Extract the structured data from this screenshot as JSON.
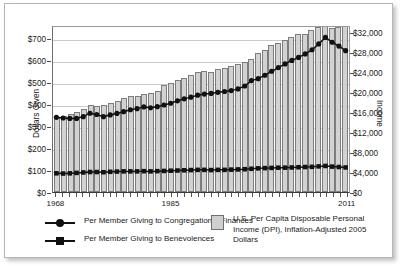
{
  "chart_data": {
    "type": "bar",
    "title": "",
    "xlabel": "",
    "ylabel": "Dollars Given",
    "y2label": "Income",
    "grid": true,
    "legend_position": "bottom",
    "x": [
      1968,
      1969,
      1970,
      1971,
      1972,
      1973,
      1974,
      1975,
      1976,
      1977,
      1978,
      1979,
      1980,
      1981,
      1982,
      1983,
      1984,
      1985,
      1986,
      1987,
      1988,
      1989,
      1990,
      1991,
      1992,
      1993,
      1994,
      1995,
      1996,
      1997,
      1998,
      1999,
      2000,
      2001,
      2002,
      2003,
      2004,
      2005,
      2006,
      2007,
      2008,
      2009,
      2010,
      2011
    ],
    "xtick_labels": [
      "1968",
      "1985",
      "2011"
    ],
    "xtick_values": [
      1968,
      1985,
      2011
    ],
    "ylim": [
      0,
      760
    ],
    "ytick_labels": [
      "$0",
      "$100",
      "$200",
      "$300",
      "$400",
      "$500",
      "$600",
      "$700"
    ],
    "ytick_values": [
      0,
      100,
      200,
      300,
      400,
      500,
      600,
      700
    ],
    "y2lim": [
      0,
      33500
    ],
    "y2tick_labels": [
      "$0",
      "$4,000",
      "$8,000",
      "$12,000",
      "$16,000",
      "$20,000",
      "$24,000",
      "$28,000",
      "$32,000"
    ],
    "y2tick_values": [
      0,
      4000,
      8000,
      12000,
      16000,
      20000,
      24000,
      28000,
      32000
    ],
    "series": [
      {
        "name": "U.S. Per Capita Disposable Personal Income (DPI), Inflation-Adjusted 2005 Dollars",
        "type": "bar",
        "axis": "right",
        "color": "#d2d2d2",
        "edge_color": "#7d7d7d",
        "values": [
          14900,
          15300,
          15700,
          16000,
          16600,
          17500,
          17300,
          17500,
          17900,
          18200,
          18900,
          19200,
          19200,
          19600,
          19800,
          20300,
          21500,
          21900,
          22500,
          22800,
          23500,
          24000,
          24200,
          24100,
          24700,
          24800,
          25200,
          25700,
          26100,
          26700,
          27900,
          28500,
          29500,
          29800,
          30400,
          31000,
          31700,
          31600,
          32500,
          33200,
          33600,
          33000,
          33200,
          33600
        ],
        "marker": "bar"
      },
      {
        "name": "Per Member Giving to Congregational Finances",
        "type": "line",
        "axis": "left",
        "color": "#111111",
        "marker": "circle",
        "values": [
          344,
          341,
          339,
          339,
          347,
          363,
          357,
          347,
          355,
          362,
          370,
          379,
          384,
          392,
          388,
          393,
          401,
          409,
          420,
          429,
          437,
          446,
          451,
          454,
          459,
          463,
          467,
          475,
          488,
          513,
          522,
          538,
          556,
          573,
          590,
          606,
          620,
          636,
          655,
          682,
          712,
          690,
          672,
          651
        ]
      },
      {
        "name": "Per Member Giving to Benevolences",
        "type": "line",
        "axis": "left",
        "color": "#111111",
        "marker": "square",
        "values": [
          86,
          85,
          86,
          88,
          90,
          92,
          92,
          91,
          93,
          94,
          95,
          95,
          95,
          96,
          95,
          96,
          97,
          98,
          99,
          100,
          101,
          102,
          102,
          101,
          102,
          102,
          103,
          104,
          105,
          107,
          109,
          110,
          111,
          112,
          112,
          113,
          114,
          115,
          116,
          118,
          120,
          117,
          115,
          113
        ]
      }
    ],
    "annotations": []
  },
  "axes": {
    "left_title": "Dollars Given",
    "right_title": "Income"
  },
  "legend": {
    "items": [
      {
        "label": "Per Member Giving to Congregational Finances",
        "marker": "circle-line-marker"
      },
      {
        "label": "Per Member Giving to Benevolences",
        "marker": "square-line-marker"
      },
      {
        "label": "U.S. Per Capita Disposable Personal Income (DPI), Inflation-Adjusted 2005 Dollars",
        "marker": "gray-square-swatch"
      }
    ]
  }
}
